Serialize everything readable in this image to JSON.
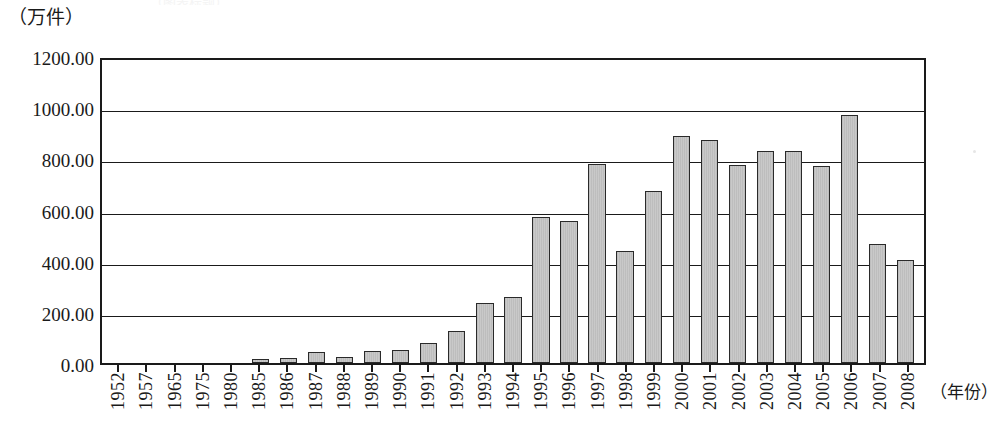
{
  "chart_data": {
    "type": "bar",
    "title": "",
    "xlabel": "（年份）",
    "ylabel": "（万件）",
    "ylim": [
      0,
      1200
    ],
    "ytick_labels": [
      "0.00",
      "200.00",
      "400.00",
      "600.00",
      "800.00",
      "1000.00",
      "1200.00"
    ],
    "ytick_values": [
      0,
      200,
      400,
      600,
      800,
      1000,
      1200
    ],
    "grid": true,
    "legend": "none",
    "bar_color": "#c9c9c9",
    "bar_edge_color": "#2a2a2a",
    "axis_color": "#1a1a1a",
    "categories": [
      "1952",
      "1957",
      "1965",
      "1975",
      "1980",
      "1985",
      "1986",
      "1987",
      "1988",
      "1989",
      "1990",
      "1991",
      "1992",
      "1993",
      "1994",
      "1995",
      "1996",
      "1997",
      "1998",
      "1999",
      "2000",
      "2001",
      "2002",
      "2003",
      "2004",
      "2005",
      "2006",
      "2007",
      "2008"
    ],
    "values": [
      0,
      0,
      0,
      0,
      0,
      14,
      21,
      45,
      25,
      47,
      52,
      78,
      127,
      236,
      259,
      570,
      557,
      777,
      437,
      672,
      888,
      872,
      775,
      827,
      827,
      770,
      968,
      465,
      403
    ]
  },
  "axis": {
    "y_unit_label": "（万件）",
    "x_unit_label": "（年份）"
  },
  "title_remnant": "（图表标题）"
}
